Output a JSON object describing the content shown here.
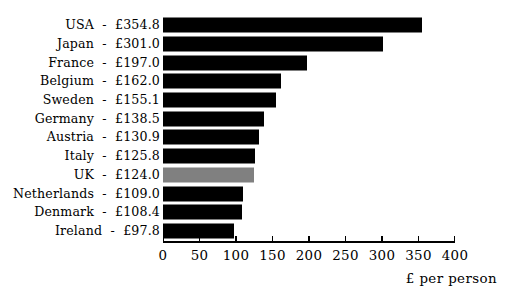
{
  "chart_data": {
    "type": "bar",
    "orientation": "horizontal",
    "title": "",
    "xlabel": "£ per person",
    "ylabel": "",
    "xlim": [
      0,
      400
    ],
    "xticks": [
      0,
      50,
      100,
      150,
      200,
      250,
      300,
      350,
      400
    ],
    "xtick_labels": [
      "0",
      "50",
      "100",
      "150",
      "200",
      "250",
      "300",
      "350",
      "400"
    ],
    "grid": false,
    "legend": false,
    "categories": [
      "USA",
      "Japan",
      "France",
      "Belgium",
      "Sweden",
      "Germany",
      "Austria",
      "Italy",
      "UK",
      "Netherlands",
      "Denmark",
      "Ireland"
    ],
    "values": [
      354.8,
      301.0,
      197.0,
      162.0,
      155.1,
      138.5,
      130.9,
      125.8,
      124.0,
      109.0,
      108.4,
      97.8
    ],
    "value_labels": [
      "£354.8",
      "£301.0",
      "£197.0",
      "£162.0",
      "£155.1",
      "£138.5",
      "£130.9",
      "£125.8",
      "£124.0",
      "£109.0",
      "£108.4",
      "£97.8"
    ],
    "row_labels": [
      "USA  -  £354.8",
      "Japan  -  £301.0",
      "France  -  £197.0",
      "Belgium  -  £162.0",
      "Sweden  -  £155.1",
      "Germany  -  £138.5",
      "Austria  -  £130.9",
      "Italy  -  £125.8",
      "UK  -  £124.0",
      "Netherlands  -  £109.0",
      "Denmark  -  £108.4",
      "Ireland  -  £97.8"
    ],
    "bar_colors": [
      "#000000",
      "#000000",
      "#000000",
      "#000000",
      "#000000",
      "#000000",
      "#000000",
      "#000000",
      "#808080",
      "#000000",
      "#000000",
      "#000000"
    ],
    "highlighted_category": "UK",
    "highlight_color": "#808080",
    "default_bar_color": "#000000",
    "axis_color": "#000000",
    "background_color": "#ffffff"
  }
}
